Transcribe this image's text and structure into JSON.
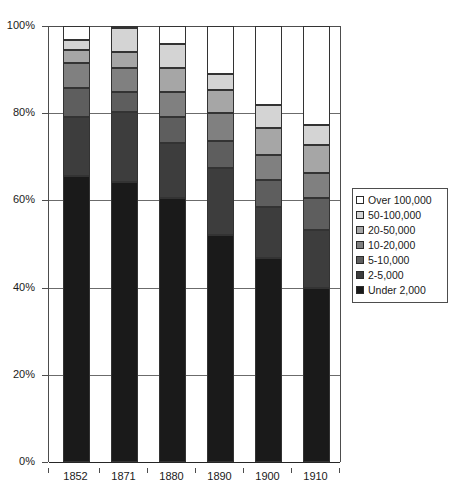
{
  "chart_data": {
    "type": "bar",
    "subtype": "stacked-percentage-column",
    "title": "",
    "subtitle": "",
    "xlabel": "",
    "ylabel": "",
    "categories": [
      "1852",
      "1871",
      "1880",
      "1890",
      "1900",
      "1910"
    ],
    "ylim": [
      0,
      100
    ],
    "y_unit": "%",
    "y_ticks": [
      "0%",
      "20%",
      "40%",
      "60%",
      "80%",
      "100%"
    ],
    "y_tick_values": [
      0,
      20,
      40,
      60,
      80,
      100
    ],
    "grid": true,
    "legend_position": "right",
    "stack_order_bottom_to_top": [
      "Under 2,000",
      "2-5,000",
      "5-10,000",
      "10-20,000",
      "20-50,000",
      "50-100,000",
      "Over 100,000"
    ],
    "series": [
      {
        "name": "Under 2,000",
        "color": "#1a1a1a",
        "values": [
          65.6,
          64.2,
          60.6,
          52.1,
          46.8,
          39.9
        ]
      },
      {
        "name": "2-5,000",
        "color": "#3d3d3d",
        "values": [
          13.5,
          16.1,
          12.6,
          15.4,
          11.7,
          13.3
        ]
      },
      {
        "name": "5-10,000",
        "color": "#5e5e5e",
        "values": [
          6.7,
          4.6,
          6.0,
          6.2,
          6.2,
          7.3
        ]
      },
      {
        "name": "10-20,000",
        "color": "#808080",
        "values": [
          5.7,
          5.5,
          5.7,
          6.4,
          5.7,
          5.7
        ]
      },
      {
        "name": "20-50,000",
        "color": "#a6a6a6",
        "values": [
          3.0,
          3.7,
          5.5,
          5.3,
          6.2,
          6.4
        ]
      },
      {
        "name": "50-100,000",
        "color": "#d4d4d4",
        "values": [
          2.3,
          5.5,
          5.5,
          3.7,
          5.3,
          4.6
        ]
      },
      {
        "name": "Over 100,000",
        "color": "#ffffff",
        "values": [
          3.2,
          0.4,
          4.1,
          10.9,
          18.1,
          22.8
        ]
      }
    ]
  },
  "legend": {
    "items": [
      {
        "label": "Over 100,000",
        "color": "#ffffff"
      },
      {
        "label": "50-100,000",
        "color": "#d4d4d4"
      },
      {
        "label": "20-50,000",
        "color": "#a6a6a6"
      },
      {
        "label": "10-20,000",
        "color": "#808080"
      },
      {
        "label": "5-10,000",
        "color": "#5e5e5e"
      },
      {
        "label": "2-5,000",
        "color": "#3d3d3d"
      },
      {
        "label": "Under 2,000",
        "color": "#1a1a1a"
      }
    ]
  },
  "axes": {
    "y_labels": [
      "100%",
      "80%",
      "60%",
      "40%",
      "20%",
      "0%"
    ],
    "x_labels": [
      "1852",
      "1871",
      "1880",
      "1890",
      "1900",
      "1910"
    ]
  },
  "colors": {
    "axis": "#4d4d4d",
    "grid": "#6b6b6b",
    "text": "#1a1a1a",
    "segment_border": "#333333",
    "background": "#ffffff"
  }
}
